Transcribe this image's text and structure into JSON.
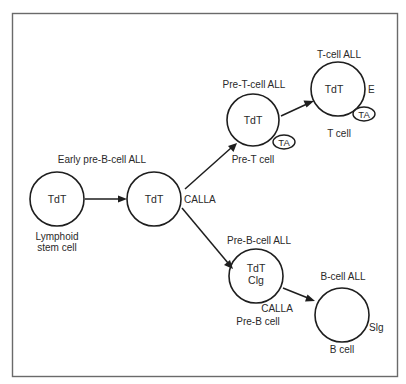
{
  "diagram": {
    "colors": {
      "frame": "#6a6a6a",
      "ink": "#1e1e1e",
      "text": "#2a2a2a",
      "background": "#ffffff"
    },
    "stages": {
      "lymphoid_stem_cell": {
        "markers": [
          "TdT"
        ],
        "name_line1": "Lymphoid",
        "name_line2": "stem cell"
      },
      "early_pre_b": {
        "leukemia": "Early pre-B-cell ALL",
        "markers": [
          "TdT"
        ],
        "surface_marker": "CALLA"
      },
      "pre_t": {
        "leukemia": "Pre-T-cell ALL",
        "markers": [
          "TdT"
        ],
        "surface_badge": "TA",
        "name": "Pre-T cell"
      },
      "t_cell": {
        "leukemia": "T-cell ALL",
        "markers": [
          "TdT"
        ],
        "surface_marker": "E",
        "surface_badge": "TA",
        "name": "T cell"
      },
      "pre_b": {
        "leukemia": "Pre-B-cell ALL",
        "markers": [
          "TdT",
          "Clg"
        ],
        "surface_marker": "CALLA",
        "name": "Pre-B cell"
      },
      "b_cell": {
        "leukemia": "B-cell ALL",
        "markers": [],
        "surface_marker": "Slg",
        "name": "B cell"
      }
    },
    "edges": [
      {
        "from": "lymphoid_stem_cell",
        "to": "early_pre_b"
      },
      {
        "from": "early_pre_b",
        "to": "pre_t"
      },
      {
        "from": "pre_t",
        "to": "t_cell"
      },
      {
        "from": "early_pre_b",
        "to": "pre_b"
      },
      {
        "from": "pre_b",
        "to": "b_cell"
      }
    ]
  }
}
